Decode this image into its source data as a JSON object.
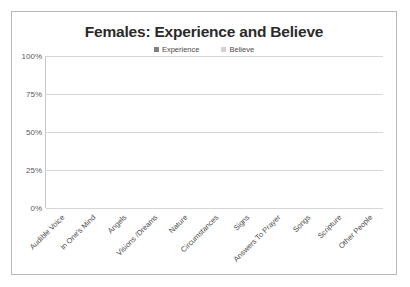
{
  "chart_data": {
    "type": "bar",
    "subtype": "stacked-bar",
    "title": "Females: Experience and Believe",
    "xlabel": "",
    "ylabel": "",
    "ylim": [
      0,
      100
    ],
    "yticks": [
      "0%",
      "25%",
      "50%",
      "75%",
      "100%"
    ],
    "ytick_values": [
      0,
      25,
      50,
      75,
      100
    ],
    "grid": true,
    "legend_position": "top-center",
    "categories": [
      "Audible Voice",
      "In One's Mind",
      "Angels",
      "Visions /Dreams",
      "Nature",
      "Circumstances",
      "Signs",
      "Answers To Prayer",
      "Songs",
      "Scripture",
      "Other People"
    ],
    "series": [
      {
        "name": "Experience",
        "color": "#808080",
        "values": [
          13,
          65,
          17,
          44,
          44,
          66,
          47,
          79,
          66,
          74,
          71
        ]
      },
      {
        "name": "Believe",
        "color": "#d2d2d2",
        "values": [
          36,
          20,
          48,
          38,
          41,
          21,
          31,
          14,
          18,
          19,
          15
        ]
      }
    ],
    "totals": [
      49,
      85,
      65,
      82,
      85,
      87,
      78,
      93,
      84,
      93,
      86
    ]
  },
  "colors": {
    "experience": "#808080",
    "believe": "#d2d2d2",
    "gridline": "#d6d6d6",
    "frame_border": "#b9b9b9",
    "title_text": "#2a2a2a",
    "axis_text": "#595959"
  }
}
